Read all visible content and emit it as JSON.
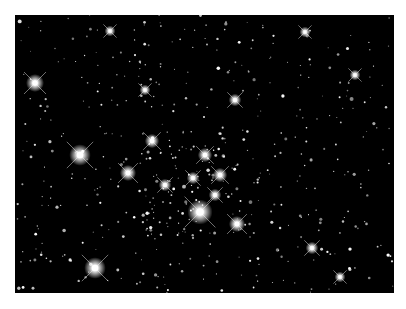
{
  "image": {
    "subject": "star cluster field",
    "background_color": "#000000",
    "page_color": "#ffffff",
    "star_color": "#ffffff",
    "bright_stars": [
      {
        "x": 20,
        "y": 68,
        "r": 5
      },
      {
        "x": 65,
        "y": 140,
        "r": 6
      },
      {
        "x": 113,
        "y": 158,
        "r": 4.5
      },
      {
        "x": 137,
        "y": 126,
        "r": 4
      },
      {
        "x": 185,
        "y": 197,
        "r": 7
      },
      {
        "x": 190,
        "y": 140,
        "r": 4
      },
      {
        "x": 205,
        "y": 160,
        "r": 4
      },
      {
        "x": 178,
        "y": 163,
        "r": 3.5
      },
      {
        "x": 150,
        "y": 170,
        "r": 3.5
      },
      {
        "x": 200,
        "y": 180,
        "r": 3.5
      },
      {
        "x": 222,
        "y": 209,
        "r": 4.5
      },
      {
        "x": 220,
        "y": 85,
        "r": 3.5
      },
      {
        "x": 80,
        "y": 253,
        "r": 6
      },
      {
        "x": 297,
        "y": 233,
        "r": 3.5
      },
      {
        "x": 340,
        "y": 60,
        "r": 3
      },
      {
        "x": 95,
        "y": 16,
        "r": 3
      },
      {
        "x": 290,
        "y": 17,
        "r": 3
      },
      {
        "x": 130,
        "y": 75,
        "r": 3
      },
      {
        "x": 325,
        "y": 262,
        "r": 3
      }
    ],
    "faint_star_count": 520,
    "seed": 42
  }
}
